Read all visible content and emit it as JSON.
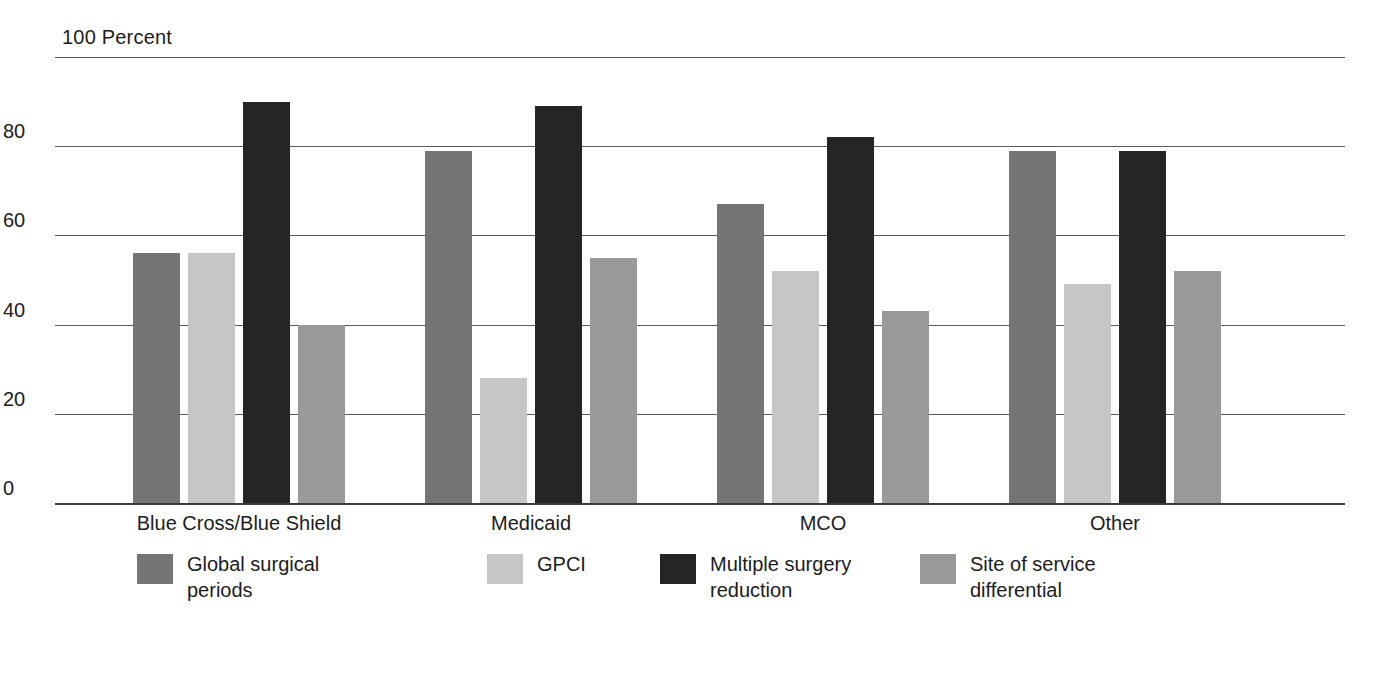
{
  "chart_data": {
    "type": "bar",
    "title": "",
    "axis_title": "100 Percent",
    "xlabel": "",
    "ylabel": "Percent",
    "ylim": [
      0,
      100
    ],
    "yticks": [
      100,
      80,
      60,
      40,
      20,
      0
    ],
    "ytick_labels": [
      "100",
      "80",
      "60",
      "40",
      "20",
      "0"
    ],
    "grid": true,
    "legend_position": "bottom",
    "categories": [
      "Blue Cross/Blue Shield",
      "Medicaid",
      "MCO",
      "Other"
    ],
    "series": [
      {
        "name": "Global surgical periods",
        "color": "#757575",
        "values": [
          56,
          79,
          67,
          79
        ]
      },
      {
        "name": "GPCI",
        "color": "#c6c6c6",
        "values": [
          56,
          28,
          52,
          49
        ]
      },
      {
        "name": "Multiple surgery reduction",
        "color": "#252525",
        "values": [
          90,
          89,
          82,
          79
        ]
      },
      {
        "name": "Site of service differential",
        "color": "#9a9a9a",
        "values": [
          40,
          55,
          43,
          52
        ]
      }
    ]
  },
  "axis": {
    "percent_label": "100 Percent",
    "tick_100": "100",
    "tick_80": "80",
    "tick_60": "60",
    "tick_40": "40",
    "tick_20": "20",
    "tick_0": "0"
  },
  "categories": {
    "cat_0": "Blue Cross/Blue Shield",
    "cat_1": "Medicaid",
    "cat_2": "MCO",
    "cat_3": "Other"
  },
  "legend": {
    "item_0": "Global surgical periods",
    "item_1": "GPCI",
    "item_2": "Multiple surgery reduction",
    "item_3": "Site of service differential"
  },
  "colors": {
    "series_0": "#757575",
    "series_1": "#c6c6c6",
    "series_2": "#252525",
    "series_3": "#9a9a9a",
    "grid": "#5a5a5a",
    "axis": "#3a3a3a",
    "text": "#1c1c1c",
    "background": "#ffffff"
  }
}
